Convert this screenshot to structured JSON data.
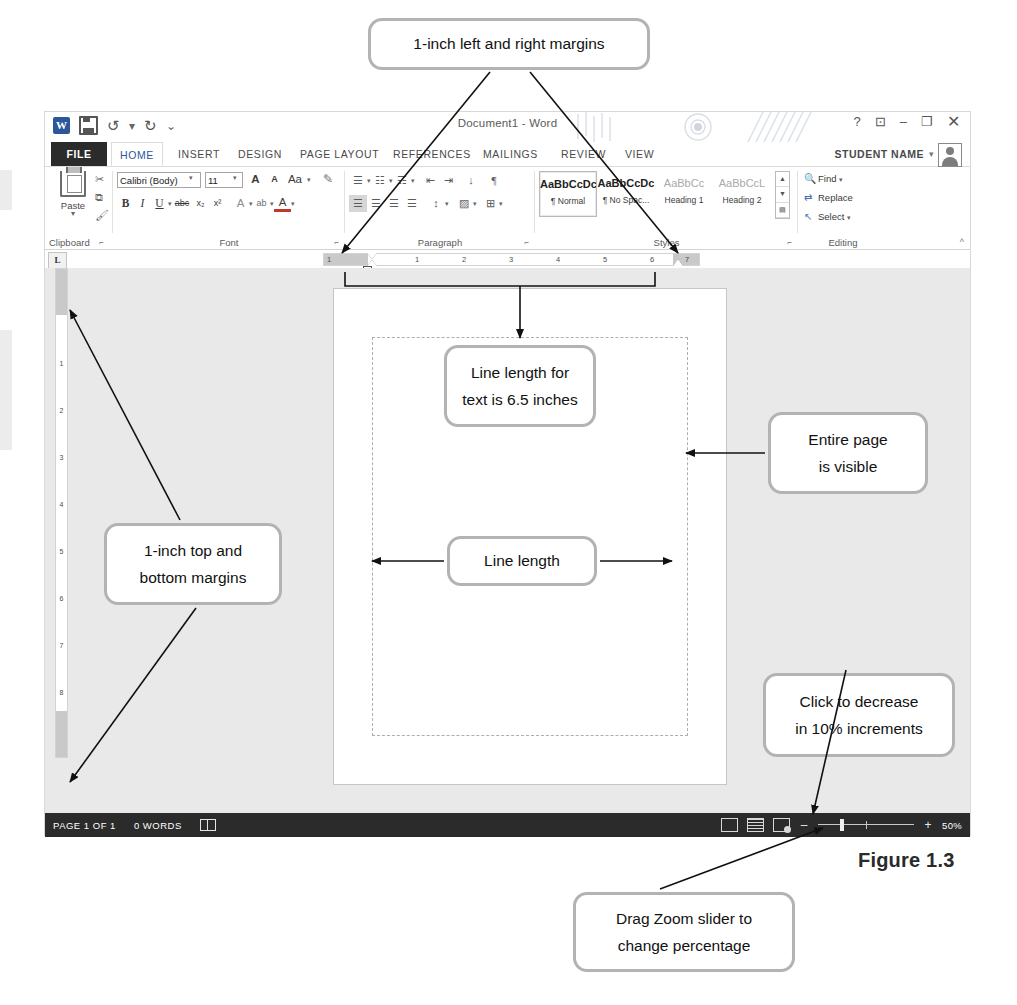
{
  "figure": {
    "caption": "Figure 1.3"
  },
  "window": {
    "title": "Document1 - Word",
    "quick_access": [
      "word-logo-icon",
      "save-icon",
      "undo-icon",
      "redo-icon",
      "customize-qat-icon"
    ],
    "controls": {
      "help": "?",
      "ribbon_display": "ribbon-display-icon",
      "minimize": "–",
      "restore": "❐",
      "close": "✕"
    },
    "account": {
      "name": "STUDENT NAME",
      "caret": "▾"
    }
  },
  "tabs": [
    {
      "label": "FILE",
      "state": "file"
    },
    {
      "label": "HOME",
      "state": "active"
    },
    {
      "label": "INSERT",
      "state": "normal"
    },
    {
      "label": "DESIGN",
      "state": "normal"
    },
    {
      "label": "PAGE LAYOUT",
      "state": "normal"
    },
    {
      "label": "REFERENCES",
      "state": "normal"
    },
    {
      "label": "MAILINGS",
      "state": "normal"
    },
    {
      "label": "REVIEW",
      "state": "normal"
    },
    {
      "label": "VIEW",
      "state": "normal"
    }
  ],
  "ribbon": {
    "groups": [
      {
        "id": "clipboard",
        "label": "Clipboard"
      },
      {
        "id": "font",
        "label": "Font"
      },
      {
        "id": "paragraph",
        "label": "Paragraph"
      },
      {
        "id": "styles",
        "label": "Styles"
      },
      {
        "id": "editing",
        "label": "Editing"
      }
    ],
    "clipboard": {
      "paste_label": "Paste",
      "paste_caret": "▾",
      "cut": "✂",
      "copy": "⧉",
      "format_painter": "🖌"
    },
    "font": {
      "font_name": "Calibri (Body)",
      "font_size": "11",
      "caret": "▾",
      "grow_font": "A",
      "shrink_font": "A",
      "change_case": "Aa",
      "clear_formatting": "✎",
      "bold": "B",
      "italic": "I",
      "underline": "U",
      "strikethrough": "abc",
      "subscript": "x₂",
      "superscript": "x²",
      "text_effects": "A",
      "highlight": "ab",
      "font_color": "A"
    },
    "paragraph": {
      "bullets": "☰",
      "numbering": "☷",
      "multilevel": "☶",
      "decrease_indent": "⇤",
      "increase_indent": "⇥",
      "sort": "↓",
      "show_marks": "¶",
      "align_left": "☰",
      "align_center": "☰",
      "align_right": "☰",
      "justify": "☰",
      "line_spacing": "↕",
      "shading": "▨",
      "borders": "⊞"
    },
    "styles": {
      "items": [
        {
          "preview": "AaBbCcDc",
          "name": "¶ Normal",
          "selected": true,
          "tone": "dark"
        },
        {
          "preview": "AaBbCcDc",
          "name": "¶ No Spac...",
          "selected": false,
          "tone": "dark"
        },
        {
          "preview": "AaBbCc",
          "name": "Heading 1",
          "selected": false,
          "tone": "grey"
        },
        {
          "preview": "AaBbCcL",
          "name": "Heading 2",
          "selected": false,
          "tone": "grey"
        }
      ],
      "scroll": [
        "▲",
        "▼",
        "▤"
      ]
    },
    "editing": {
      "find": "Find",
      "find_caret": "▾",
      "replace": "Replace",
      "select": "Select",
      "select_caret": "▾"
    },
    "collapse_ribbon": "^"
  },
  "rulers": {
    "tab_selector": "L",
    "horizontal_numbers": [
      "1",
      "1",
      "2",
      "3",
      "4",
      "5",
      "6",
      "7"
    ],
    "vertical_numbers": [
      "1",
      "2",
      "3",
      "4",
      "5",
      "6",
      "7",
      "8"
    ]
  },
  "status_bar": {
    "page": "PAGE 1 OF 1",
    "words": "0 WORDS",
    "proofing_icon": "proofing-icon",
    "views": [
      "read-mode-icon",
      "print-layout-icon",
      "web-layout-icon"
    ],
    "zoom_out": "–",
    "zoom_in": "+",
    "zoom_percent": "50%"
  },
  "callouts": [
    {
      "id": "left-right-margins",
      "lines": [
        "1-inch left and right margins"
      ]
    },
    {
      "id": "line-length-text",
      "lines": [
        "Line length for",
        "text is 6.5 inches"
      ]
    },
    {
      "id": "entire-page-visible",
      "lines": [
        "Entire page",
        "is visible"
      ]
    },
    {
      "id": "top-bottom-margins",
      "lines": [
        "1-inch top and",
        "bottom margins"
      ]
    },
    {
      "id": "line-length",
      "lines": [
        "Line length"
      ]
    },
    {
      "id": "click-to-decrease",
      "lines": [
        "Click to decrease",
        "in 10% increments"
      ]
    },
    {
      "id": "drag-zoom-slider",
      "lines": [
        "Drag Zoom slider to",
        "change percentage"
      ]
    }
  ],
  "colors": {
    "accent": "#2b579a",
    "callout_border": "#b3b3b3",
    "status_bar": "#2b2b2b",
    "doc_background": "#e9e9e9"
  }
}
